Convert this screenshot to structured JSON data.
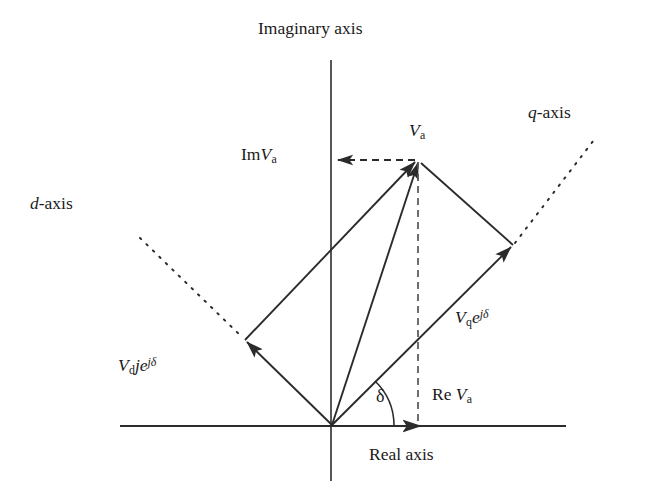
{
  "figure": {
    "type": "phasor-diagram",
    "background_color": "#ffffff",
    "line_color": "#2b2b2b"
  },
  "axes": {
    "imaginary": {
      "label": "Imaginary axis",
      "orientation": "vertical",
      "style": "solid"
    },
    "real": {
      "label": "Real axis",
      "orientation": "horizontal",
      "style": "solid"
    },
    "d_axis": {
      "label_prefix": "d",
      "label_suffix": "-axis",
      "orientation": "diagonal-up-left",
      "style": "dotted"
    },
    "q_axis": {
      "label_prefix": "q",
      "label_suffix": "-axis",
      "orientation": "diagonal-up-right",
      "style": "dotted"
    }
  },
  "labels": {
    "va": {
      "symbol": "V",
      "sub": "a"
    },
    "im_va": {
      "prefix": "Im",
      "symbol": "V",
      "sub": "a"
    },
    "re_va": {
      "prefix": "Re",
      "symbol": "V",
      "sub": "a"
    },
    "vq_exp": {
      "symbol": "V",
      "sub": "q",
      "base": "e",
      "exponent": "jδ"
    },
    "vd_exp": {
      "symbol": "V",
      "sub": "d",
      "mid": "j",
      "base": "e",
      "exponent": "jδ"
    },
    "delta": {
      "symbol": "δ",
      "meaning": "load-angle"
    }
  },
  "geometry": {
    "origin": {
      "x": 332,
      "y": 425
    },
    "apex_va": {
      "x": 418,
      "y": 160
    },
    "d_component_tip": {
      "x": 245,
      "y": 340
    },
    "q_component_tip": {
      "x": 513,
      "y": 245
    },
    "imaginary_axis_line": {
      "x": 331,
      "y1": 60,
      "y2": 481
    },
    "real_axis_line": {
      "y": 426,
      "x1": 120,
      "x2": 566
    },
    "real_axis_arrow_x": 420,
    "d_axis_dotted": {
      "x1": 140,
      "y1": 238,
      "x2": 245,
      "y2": 340
    },
    "q_axis_dotted": {
      "x1": 513,
      "y1": 245,
      "x2": 596,
      "y2": 137
    },
    "im_projection_dashed": {
      "from_x": 418,
      "from_y": 160,
      "to_x": 336,
      "to_y": 160
    },
    "re_projection_dashed": {
      "x": 418,
      "y1": 160,
      "y2": 426
    },
    "delta_arc_radius": 62,
    "delta_degrees": 45
  }
}
